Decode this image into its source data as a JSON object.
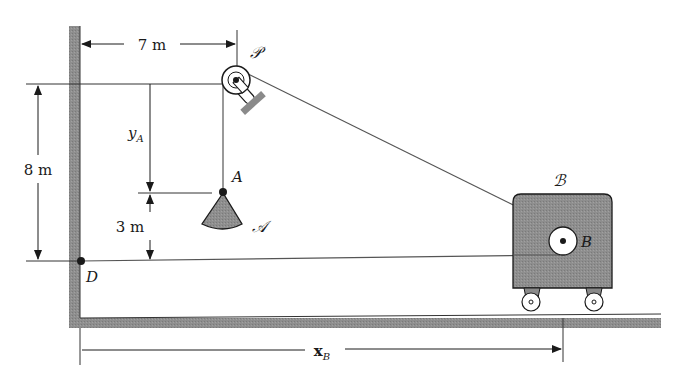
{
  "diagram": {
    "colors": {
      "ink": "#1a1a1a",
      "fill_gray": "#8c8c8c",
      "wall_gray": "#8a8a8a",
      "line": "#444444"
    },
    "labels": {
      "pulley": "𝒫",
      "point_A": "A",
      "body_A": "𝒜",
      "point_B": "B",
      "body_B": "ℬ",
      "point_D": "D"
    },
    "dimensions": {
      "horizontal_7": "7 m",
      "vertical_8": "8 m",
      "vertical_3": "3 m",
      "yA_main": "y",
      "yA_sub": "A",
      "xB_main": "x",
      "xB_sub": "B"
    }
  }
}
